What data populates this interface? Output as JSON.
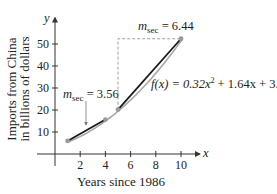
{
  "chart_data": {
    "type": "line",
    "title": "",
    "xlabel": "Years since 1986",
    "ylabel_lines": [
      "Imports from China",
      "in billions of dollars"
    ],
    "x_axis_letter": "x",
    "y_axis_letter": "y",
    "xlim": [
      0,
      11.5
    ],
    "ylim": [
      0,
      62
    ],
    "x_ticks": [
      2,
      4,
      6,
      8,
      10
    ],
    "x_tick_labels": [
      "2",
      "4",
      "6",
      "8",
      "10"
    ],
    "y_ticks": [
      10,
      20,
      30,
      40,
      50
    ],
    "y_tick_labels": [
      "10",
      "20",
      "30",
      "40",
      "50"
    ],
    "grid": false,
    "function": {
      "label_prefix": "f(x) = 0.32x",
      "label_exp": "2",
      "label_suffix": " + 1.64x + 3.98",
      "coefficients": [
        0.32,
        1.64,
        3.98
      ],
      "domain": [
        1,
        10
      ]
    },
    "points": [
      {
        "x": 1,
        "y": 5.94
      },
      {
        "x": 4,
        "y": 15.66
      },
      {
        "x": 5,
        "y": 20.18
      },
      {
        "x": 10,
        "y": 52.38
      }
    ],
    "secants": [
      {
        "from_x": 1,
        "to_x": 4,
        "m": "m",
        "sub": "sec",
        "value_text": " = 3.56"
      },
      {
        "from_x": 5,
        "to_x": 10,
        "m": "m",
        "sub": "sec",
        "value_text": " = 6.44"
      }
    ],
    "colors": {
      "axis": "#333333",
      "curve": "#a8a8a8",
      "secant": "#1a1a1a",
      "point": "#9a9a9a",
      "dashed": "#888888"
    }
  }
}
